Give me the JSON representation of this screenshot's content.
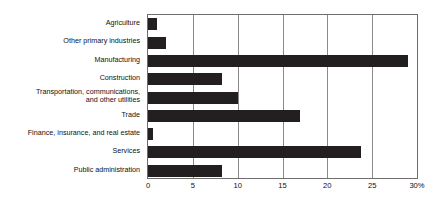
{
  "chart_data": {
    "type": "bar",
    "orientation": "horizontal",
    "title": "",
    "xlabel": "",
    "ylabel": "",
    "xlim": [
      0,
      30
    ],
    "grid": true,
    "legend": "none",
    "axis_suffix": "%",
    "categories": [
      "Agriculture",
      "Other primary industries",
      "Manufacturing",
      "Construction",
      "Transportation, communications,\nand other utilities",
      "Trade",
      "Finance, insurance, and real estate",
      "Services",
      "Public administration"
    ],
    "values": [
      1.0,
      2.0,
      29.0,
      8.3,
      10.0,
      17.0,
      0.6,
      23.7,
      8.2
    ],
    "xticks": [
      {
        "value": 0,
        "label": "0"
      },
      {
        "value": 5,
        "label": "5"
      },
      {
        "value": 10,
        "label": "10"
      },
      {
        "value": 15,
        "label": "15"
      },
      {
        "value": 20,
        "label": "20"
      },
      {
        "value": 25,
        "label": "25"
      },
      {
        "value": 30,
        "label": "30%"
      }
    ],
    "bar_color": "#231f20",
    "axis_color": "#6e6e6e",
    "grid_color": "#8a8a8a",
    "background_color": "#ffffff"
  }
}
